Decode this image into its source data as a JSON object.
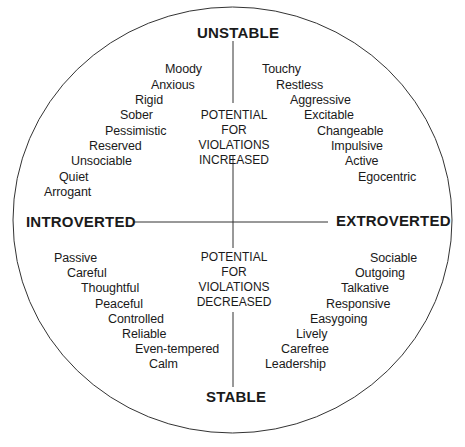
{
  "diagram": {
    "type": "personality-quadrant-circle",
    "axes": {
      "top": "UNSTABLE",
      "bottom": "STABLE",
      "left": "INTROVERTED",
      "right": "EXTROVERTED"
    },
    "center_labels": {
      "upper": [
        "POTENTIAL",
        "FOR",
        "VIOLATIONS",
        "INCREASED"
      ],
      "lower": [
        "POTENTIAL",
        "FOR",
        "VIOLATIONS",
        "DECREASED"
      ]
    },
    "quadrants": {
      "unstable_introverted": [
        "Moody",
        "Anxious",
        "Rigid",
        "Sober",
        "Pessimistic",
        "Reserved",
        "Unsociable",
        "Quiet",
        "Arrogant"
      ],
      "unstable_extroverted": [
        "Touchy",
        "Restless",
        "Aggressive",
        "Excitable",
        "Changeable",
        "Impulsive",
        "Active",
        "Egocentric"
      ],
      "stable_introverted": [
        "Passive",
        "Careful",
        "Thoughtful",
        "Peaceful",
        "Controlled",
        "Reliable",
        "Even-tempered",
        "Calm"
      ],
      "stable_extroverted": [
        "Sociable",
        "Outgoing",
        "Talkative",
        "Responsive",
        "Easygoing",
        "Lively",
        "Carefree",
        "Leadership"
      ]
    },
    "colors": {
      "line": "#333333",
      "text": "#1a1a1a",
      "background": "#ffffff"
    }
  }
}
